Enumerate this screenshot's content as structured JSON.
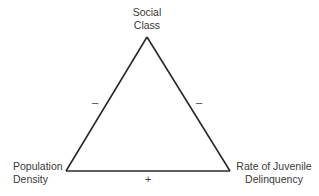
{
  "diagram": {
    "type": "causal-triangle",
    "nodes": [
      {
        "id": "social_class",
        "line1": "Social",
        "line2": "Class"
      },
      {
        "id": "population_density",
        "line1": "Population",
        "line2": "Density"
      },
      {
        "id": "delinquency",
        "line1": "Rate of Juvenile",
        "line2": "Delinquency"
      }
    ],
    "edges": [
      {
        "from": "social_class",
        "to": "population_density",
        "sign": "–"
      },
      {
        "from": "social_class",
        "to": "delinquency",
        "sign": "–"
      },
      {
        "from": "population_density",
        "to": "delinquency",
        "sign": "+"
      }
    ],
    "line_color": "#2a2a2a"
  }
}
